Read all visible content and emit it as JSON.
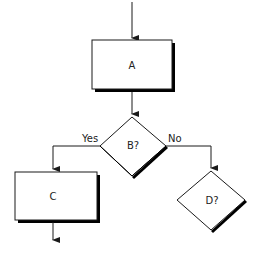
{
  "diagram": {
    "type": "flowchart",
    "nodes": [
      {
        "id": "A",
        "shape": "process",
        "label": "A"
      },
      {
        "id": "B",
        "shape": "decision",
        "label": "B?"
      },
      {
        "id": "C",
        "shape": "process",
        "label": "C"
      },
      {
        "id": "D",
        "shape": "decision",
        "label": "D?"
      }
    ],
    "edges": [
      {
        "from": "start",
        "to": "A",
        "label": ""
      },
      {
        "from": "A",
        "to": "B",
        "label": ""
      },
      {
        "from": "B",
        "to": "C",
        "label": "Yes"
      },
      {
        "from": "B",
        "to": "D",
        "label": "No"
      },
      {
        "from": "C",
        "to": "end",
        "label": ""
      }
    ],
    "colors": {
      "stroke": "#1a1a1a",
      "shadow": "#000000",
      "fill": "#ffffff"
    }
  }
}
